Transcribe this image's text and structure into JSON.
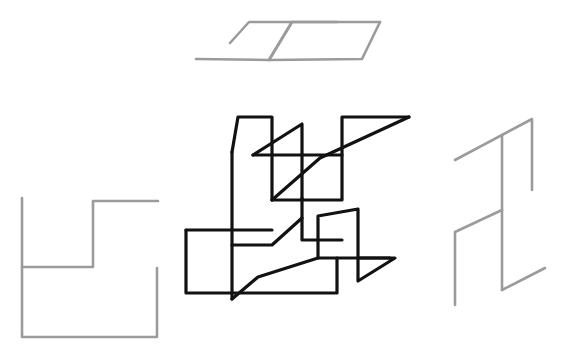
{
  "canvas": {
    "width": 565,
    "height": 358,
    "background_color": "#ffffff",
    "description": "Hand-drawn style line sketch with three separate wireframe shapes"
  },
  "styles": {
    "primary_stroke_color": "#121212",
    "secondary_stroke_color": "#9b9b9b",
    "primary_stroke_width": 3.2,
    "secondary_stroke_width": 2.6
  },
  "shapes": {
    "top_gray_figure": {
      "name": "top-parallelogram-sketch",
      "color": "#9b9b9b",
      "paths": [
        "M 196 59 L 269 60 L 292 22 L 380 22",
        "M 230 43 L 249 22 L 337 22",
        "M 380 22 L 362 59 L 269 60",
        "M 292 22 L 269 60"
      ]
    },
    "left_gray_figure": {
      "name": "left-step-outline-sketch",
      "color": "#9b9b9b",
      "paths": [
        "M 22 198 L 22 337 L 157 337 L 157 268",
        "M 22 267 L 93 267 L 93 201 L 158 201"
      ]
    },
    "right_gray_figure": {
      "name": "right-zigzag-sketch",
      "color": "#9b9b9b",
      "paths": [
        "M 455 160 L 532 119 L 532 190",
        "M 502 135 L 502 290",
        "M 502 210 L 455 232 L 455 305",
        "M 502 290 L 545 268"
      ]
    },
    "center_black_figure": {
      "name": "center-interlocking-sketch",
      "color": "#121212",
      "paths": [
        "M 232 152 L 232 245 L 232 299",
        "M 232 152 L 238 117 L 272 117 L 272 200",
        "M 253 155 L 302 124 L 302 198",
        "M 253 155 L 342 155 L 342 117 L 409 117",
        "M 409 117 L 320 158 L 272 200",
        "M 272 200 L 342 200 L 342 155",
        "M 302 198 L 302 240 L 342 240",
        "M 232 245 L 272 245 L 302 218",
        "M 232 299 L 258 277 L 318 258 L 390 258",
        "M 186 230 L 272 230",
        "M 186 230 L 186 293 L 337 293 L 337 258",
        "M 318 258 L 318 216 L 358 209 L 358 258",
        "M 358 258 L 395 258 L 358 281 L 358 258"
      ]
    }
  }
}
